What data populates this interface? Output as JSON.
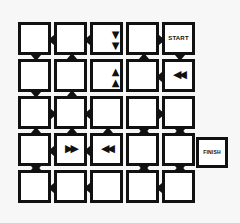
{
  "diagram": {
    "type": "maze-puzzle",
    "grid": {
      "rows": 5,
      "cols": 5
    },
    "start_label": "START",
    "finish_label": "FINISH",
    "colors": {
      "line": "#111111",
      "cell_fill": "#ffffff",
      "background": "#f7f7f7"
    },
    "glyphs": {
      "down": "⯯",
      "up": "⯭",
      "left": "◀◀",
      "right": "▶▶"
    },
    "cells": [
      {
        "row": 0,
        "col": 0,
        "content": "",
        "notches": [
          "d"
        ]
      },
      {
        "row": 0,
        "col": 1,
        "content": "",
        "notches": [
          "l"
        ]
      },
      {
        "row": 0,
        "col": 2,
        "content": "down-double-arrow",
        "glyph": "▼▼",
        "notches": [
          "l"
        ]
      },
      {
        "row": 0,
        "col": 3,
        "content": "",
        "notches": [
          "r"
        ]
      },
      {
        "row": 0,
        "col": 4,
        "content": "start",
        "label": "START",
        "notches": [
          "d"
        ]
      },
      {
        "row": 1,
        "col": 0,
        "content": "",
        "notches": [
          "u",
          "d"
        ]
      },
      {
        "row": 1,
        "col": 1,
        "content": "",
        "notches": [
          "u",
          "l"
        ]
      },
      {
        "row": 1,
        "col": 2,
        "content": "up-double-arrow",
        "glyph": "▲▲",
        "notches": [
          "u"
        ]
      },
      {
        "row": 1,
        "col": 3,
        "content": "",
        "notches": [
          "u"
        ]
      },
      {
        "row": 1,
        "col": 4,
        "content": "left-double-arrow",
        "glyph": "◀◀",
        "notches": [
          "l"
        ]
      },
      {
        "row": 2,
        "col": 0,
        "content": "",
        "notches": [
          "r"
        ]
      },
      {
        "row": 2,
        "col": 1,
        "content": "",
        "notches": [
          "u",
          "l"
        ]
      },
      {
        "row": 2,
        "col": 2,
        "content": "",
        "notches": [
          "l"
        ]
      },
      {
        "row": 2,
        "col": 3,
        "content": "",
        "notches": [
          "r",
          "d"
        ]
      },
      {
        "row": 2,
        "col": 4,
        "content": "",
        "notches": [
          "d"
        ]
      },
      {
        "row": 3,
        "col": 0,
        "content": "",
        "notches": [
          "u",
          "d"
        ]
      },
      {
        "row": 3,
        "col": 1,
        "content": "right-double-arrow",
        "glyph": "▶▶",
        "notches": [
          "u",
          "l",
          "r"
        ]
      },
      {
        "row": 3,
        "col": 2,
        "content": "left-double-arrow",
        "glyph": "◀◀",
        "notches": [
          "u",
          "l"
        ]
      },
      {
        "row": 3,
        "col": 3,
        "content": "",
        "notches": [
          "u",
          "d"
        ]
      },
      {
        "row": 3,
        "col": 4,
        "content": "",
        "notches": [
          "u",
          "d"
        ]
      },
      {
        "row": 4,
        "col": 0,
        "content": "",
        "notches": [
          "u"
        ]
      },
      {
        "row": 4,
        "col": 1,
        "content": "",
        "notches": [
          "l"
        ]
      },
      {
        "row": 4,
        "col": 2,
        "content": "",
        "notches": [
          "l"
        ]
      },
      {
        "row": 4,
        "col": 3,
        "content": "",
        "notches": [
          "u"
        ]
      },
      {
        "row": 4,
        "col": 4,
        "content": "",
        "notches": [
          "u",
          "l"
        ]
      }
    ],
    "finish_position": {
      "row": 3,
      "beside_col": 4
    }
  }
}
